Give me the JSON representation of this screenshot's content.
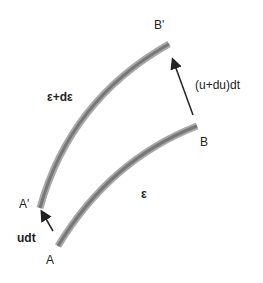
{
  "diagram": {
    "labels": {
      "b_prime": "B'",
      "b": "B",
      "a_prime": "A'",
      "a": "A",
      "eps_plus": "ε+dε",
      "eps": "ε",
      "u_du_dt": "(u+du)dt",
      "udt": "udt"
    },
    "colors": {
      "curve_outer": "#a0a0a0",
      "curve_inner": "#7a7a7a",
      "arrow": "#222222"
    }
  }
}
